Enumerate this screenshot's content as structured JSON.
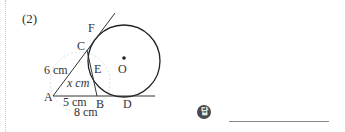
{
  "problem": {
    "number": "(2)"
  },
  "figure": {
    "points": {
      "A": "A",
      "B": "B",
      "C": "C",
      "D": "D",
      "E": "E",
      "F": "F",
      "O": "O"
    },
    "measurements": {
      "AC": "6 cm",
      "AB": "5 cm",
      "AD": "8 cm",
      "BC": "x cm"
    },
    "colors": {
      "stroke": "#333333",
      "faint_watermark": "#dcdcdc"
    }
  },
  "answer": {
    "badge_label": "답",
    "value": ""
  }
}
